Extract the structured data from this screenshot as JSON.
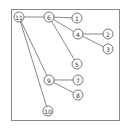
{
  "diagram": {
    "type": "tree",
    "frame": {
      "x": 11,
      "y": 9,
      "width": 108,
      "height": 111
    },
    "node_radius": 5,
    "nodes": [
      {
        "id": "11",
        "label": "11",
        "x": 19,
        "y": 17
      },
      {
        "id": "6",
        "label": "6",
        "x": 49,
        "y": 17
      },
      {
        "id": "1",
        "label": "1",
        "x": 77,
        "y": 18
      },
      {
        "id": "4",
        "label": "4",
        "x": 78,
        "y": 34
      },
      {
        "id": "2",
        "label": "2",
        "x": 108,
        "y": 34
      },
      {
        "id": "3",
        "label": "3",
        "x": 108,
        "y": 49
      },
      {
        "id": "5",
        "label": "5",
        "x": 77,
        "y": 64
      },
      {
        "id": "9",
        "label": "9",
        "x": 49,
        "y": 80
      },
      {
        "id": "7",
        "label": "7",
        "x": 78,
        "y": 80
      },
      {
        "id": "8",
        "label": "8",
        "x": 78,
        "y": 95
      },
      {
        "id": "10",
        "label": "10",
        "x": 48,
        "y": 111
      }
    ],
    "edges": [
      [
        "11",
        "6"
      ],
      [
        "11",
        "9"
      ],
      [
        "11",
        "10"
      ],
      [
        "6",
        "1"
      ],
      [
        "6",
        "4"
      ],
      [
        "6",
        "5"
      ],
      [
        "4",
        "2"
      ],
      [
        "4",
        "3"
      ],
      [
        "9",
        "7"
      ],
      [
        "9",
        "8"
      ]
    ]
  }
}
